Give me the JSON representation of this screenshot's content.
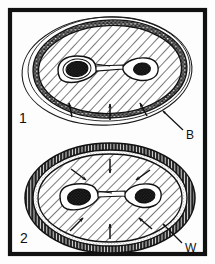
{
  "figure": {
    "type": "scientific-line-diagram",
    "caption_absent": true,
    "background_color": "#fdfdfd",
    "ink_color": "#111111",
    "frame": {
      "name": "figure-border",
      "x": 8,
      "y": 8,
      "width": 199,
      "height": 248,
      "stroke_width": 4,
      "color": "#111111"
    },
    "panels": [
      {
        "id": "panel-1",
        "number_label": "1",
        "number_x": 22,
        "number_y": 122,
        "description": "Upper oval cross-section: thin outer contour line, dark stippled band, hatched cortex with central twin-lobed organ and two dark nuclei; arrows along lower margin",
        "ellipse": {
          "cx": 110,
          "cy": 69,
          "rx": 80,
          "ry": 52,
          "rotation": -2
        },
        "outer_contour": {
          "cx": 108,
          "cy": 71,
          "rx": 86,
          "ry": 55,
          "rotation": -3
        },
        "band": {
          "style": "dark-stippled",
          "thickness": 7,
          "color": "#2a2a2a"
        },
        "interior": {
          "style": "diagonal-hatch",
          "hatch_angle_deg": 45,
          "hatch_spacing": 7,
          "color": "#1a1a1a"
        },
        "inner_organ": {
          "name": "twin-lobed-inner-body",
          "lobes": 2,
          "nuclei": 2,
          "nucleus_color": "#101010"
        },
        "arrows": [
          {
            "x1": 73,
            "y1": 118,
            "x2": 70,
            "y2": 104
          },
          {
            "x1": 110,
            "y1": 121,
            "x2": 110,
            "y2": 105
          },
          {
            "x1": 146,
            "y1": 117,
            "x2": 140,
            "y2": 104
          }
        ]
      },
      {
        "id": "panel-2",
        "number_label": "2",
        "number_x": 24,
        "number_y": 242,
        "description": "Lower oval cross-section: thick dark radially-striated wall, pale stippled subzone, hatched interior with twin-lobed organ and two dark nuclei; four arrows pointing inward",
        "ellipse": {
          "cx": 110,
          "cy": 198,
          "rx": 86,
          "ry": 56,
          "rotation": 0
        },
        "band": {
          "style": "radial-striated",
          "thickness": 9,
          "color": "#1f1f1f"
        },
        "stipple_zone": {
          "style": "fine-stipple",
          "thickness": 5,
          "color": "#6b6b6b"
        },
        "interior": {
          "style": "diagonal-hatch",
          "hatch_angle_deg": 45,
          "hatch_spacing": 7,
          "color": "#1a1a1a"
        },
        "inner_organ": {
          "name": "twin-lobed-inner-body",
          "lobes": 2,
          "nuclei": 2,
          "nucleus_color": "#101010"
        },
        "arrows": [
          {
            "x1": 72,
            "y1": 170,
            "x2": 86,
            "y2": 180
          },
          {
            "x1": 110,
            "y1": 160,
            "x2": 110,
            "y2": 173
          },
          {
            "x1": 148,
            "y1": 170,
            "x2": 136,
            "y2": 180
          },
          {
            "x1": 110,
            "y1": 238,
            "x2": 110,
            "y2": 224
          },
          {
            "x1": 70,
            "y1": 230,
            "x2": 84,
            "y2": 218
          },
          {
            "x1": 150,
            "y1": 228,
            "x2": 138,
            "y2": 218
          }
        ]
      }
    ],
    "callouts": [
      {
        "id": "callout-b",
        "label": "B",
        "label_x": 189,
        "label_y": 137,
        "leader": {
          "x1": 184,
          "y1": 129,
          "x2": 163,
          "y2": 111
        },
        "points_to": "outer contour of upper oval"
      },
      {
        "id": "callout-w",
        "label": "W",
        "label_x": 188,
        "label_y": 250,
        "leader": {
          "x1": 183,
          "y1": 242,
          "x2": 163,
          "y2": 223
        },
        "points_to": "thick dark wall of lower oval"
      }
    ]
  }
}
